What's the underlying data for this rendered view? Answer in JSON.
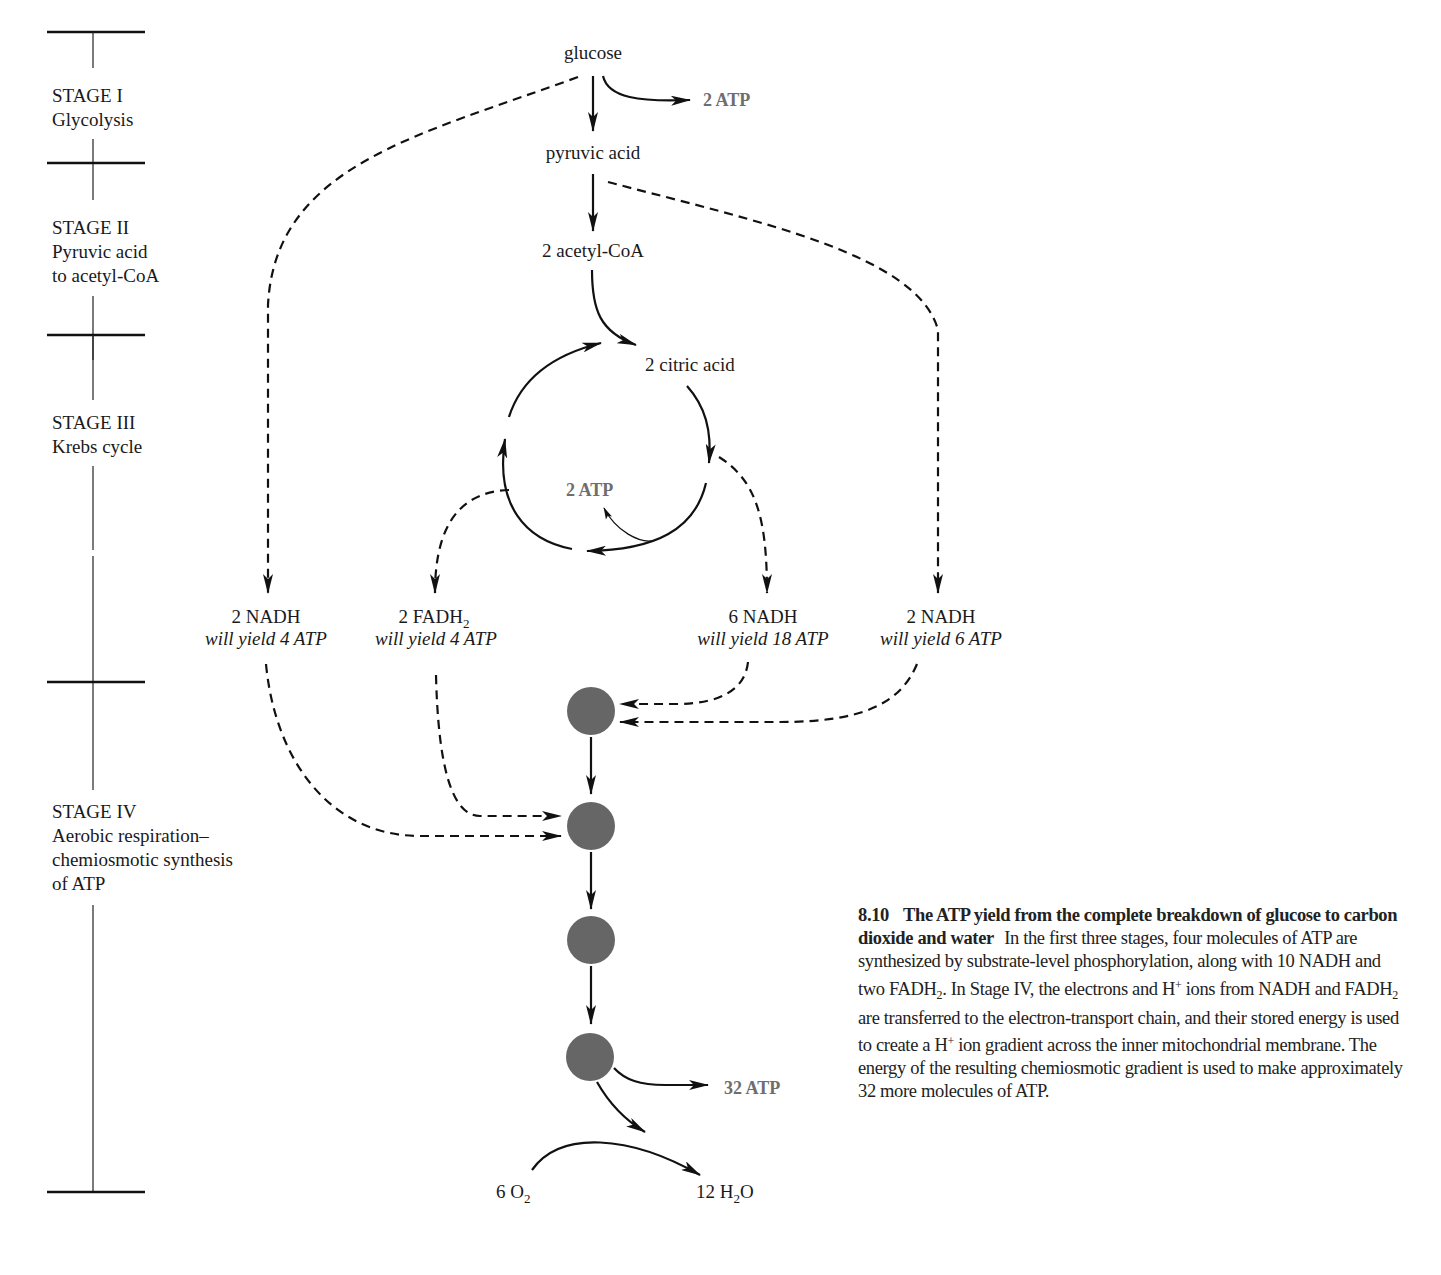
{
  "figure": {
    "stages": [
      {
        "title": "STAGE I",
        "desc_lines": [
          "Glycolysis"
        ]
      },
      {
        "title": "STAGE II",
        "desc_lines": [
          "Pyruvic acid",
          "to acetyl-CoA"
        ]
      },
      {
        "title": "STAGE III",
        "desc_lines": [
          "Krebs cycle"
        ]
      },
      {
        "title": "STAGE IV",
        "desc_lines": [
          "Aerobic respiration–",
          "chemiosmotic synthesis",
          "of ATP"
        ]
      }
    ],
    "molecules": {
      "glucose": "glucose",
      "pyruvic_acid": "pyruvic acid",
      "acetyl_coa": "2 acetyl-CoA",
      "citric_acid": "2 citric acid"
    },
    "atp_labels": {
      "glycolysis": "2 ATP",
      "krebs": "2 ATP",
      "chemiosmotic": "32 ATP"
    },
    "carriers": [
      {
        "name": "2 NADH",
        "yield": "will yield 4 ATP"
      },
      {
        "name_main": "2 FADH",
        "name_sub": "2",
        "yield": "will yield 4 ATP"
      },
      {
        "name": "6 NADH",
        "yield": "will yield 18 ATP"
      },
      {
        "name": "2 NADH",
        "yield": "will yield 6 ATP"
      }
    ],
    "oxygen": {
      "prefix": "6 O",
      "sub": "2"
    },
    "water": {
      "prefix": "12 H",
      "sub": "2",
      "suffix": "O"
    },
    "colors": {
      "atp_text": "#6e6e6e",
      "carrier_circle": "#666666",
      "line": "#111111"
    }
  },
  "caption": {
    "number": "8.10",
    "title": "The ATP yield from the complete breakdown of glucose to carbon dioxide and water",
    "body_1": "In the first three stages, four molecules of ATP are synthesized by substrate-level phosphorylation, along with 10 NADH and two FADH",
    "sub_1": "2",
    "body_2": ". In Stage IV, the electrons and H",
    "sup_1": "+",
    "body_3": " ions from NADH and FADH",
    "sub_2": "2",
    "body_4": " are transferred to the electron-transport chain, and their stored energy is used to create a H",
    "sup_2": "+",
    "body_5": " ion gradient across the inner mitochondrial membrane. The energy of the resulting chemiosmotic gradient is used to make approximately 32 more molecules of ATP."
  }
}
